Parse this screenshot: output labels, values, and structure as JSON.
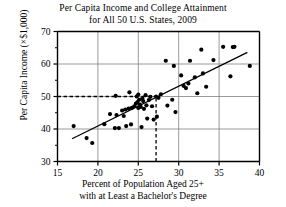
{
  "chart_data": {
    "type": "scatter",
    "title": "Per Capita Income and College Attainment for All 50 U.S. States, 2009",
    "title_lines": [
      "Per Capita Income and College Attainment",
      "for All 50 U.S. States, 2009"
    ],
    "xlabel": "Percent of Population Aged 25+ with at Least a Bachelor's Degree",
    "xlabel_lines": [
      "Percent of Population Aged 25+",
      "with at Least a Bachelor's Degree"
    ],
    "ylabel": "Per Capita Income (×$1,000)",
    "xlim": [
      15,
      40
    ],
    "ylim": [
      30,
      70
    ],
    "xticks": [
      15,
      20,
      25,
      30,
      35,
      40
    ],
    "yticks": [
      30,
      40,
      50,
      60,
      70
    ],
    "xtick_labels": [
      "15",
      "20",
      "25",
      "30",
      "35",
      "40"
    ],
    "ytick_labels": [
      "30",
      "40",
      "50",
      "60",
      "70"
    ],
    "y_minor_ticks": [
      35,
      45,
      55,
      65
    ],
    "grid": true,
    "grid_color": "#808080",
    "axis_color": "#000000",
    "point_color": "#000000",
    "point_radius": 2.1,
    "legend": null,
    "series": [
      {
        "name": "U.S. States",
        "points": [
          [
            17.0,
            40.9
          ],
          [
            18.6,
            37.2
          ],
          [
            19.3,
            35.7
          ],
          [
            20.8,
            41.5
          ],
          [
            21.5,
            44.6
          ],
          [
            22.1,
            40.3
          ],
          [
            22.2,
            50.2
          ],
          [
            22.3,
            44.3
          ],
          [
            22.6,
            40.3
          ],
          [
            23.0,
            45.7
          ],
          [
            23.2,
            44.0
          ],
          [
            23.4,
            46.0
          ],
          [
            23.5,
            40.9
          ],
          [
            23.8,
            46.3
          ],
          [
            23.9,
            51.3
          ],
          [
            24.1,
            41.4
          ],
          [
            24.2,
            46.5
          ],
          [
            24.5,
            47.0
          ],
          [
            24.7,
            47.8
          ],
          [
            24.8,
            50.0
          ],
          [
            24.9,
            48.3
          ],
          [
            25.0,
            46.5
          ],
          [
            25.0,
            50.6
          ],
          [
            25.1,
            49.0
          ],
          [
            25.2,
            47.5
          ],
          [
            25.3,
            46.8
          ],
          [
            25.4,
            40.6
          ],
          [
            25.5,
            49.4
          ],
          [
            25.6,
            48.6
          ],
          [
            25.7,
            46.2
          ],
          [
            25.9,
            50.4
          ],
          [
            26.0,
            47.3
          ],
          [
            26.1,
            43.2
          ],
          [
            26.3,
            48.9
          ],
          [
            26.5,
            49.9
          ],
          [
            26.7,
            47.0
          ],
          [
            26.9,
            42.9
          ],
          [
            27.2,
            50.0
          ],
          [
            27.3,
            43.8
          ],
          [
            27.5,
            49.6
          ],
          [
            27.8,
            50.7
          ],
          [
            28.4,
            61.0
          ],
          [
            28.6,
            47.2
          ],
          [
            29.2,
            49.0
          ],
          [
            29.4,
            59.4
          ],
          [
            29.6,
            45.2
          ],
          [
            30.3,
            56.5
          ],
          [
            30.6,
            53.3
          ],
          [
            30.9,
            52.6
          ],
          [
            31.2,
            54.0
          ],
          [
            31.4,
            61.0
          ],
          [
            32.0,
            55.9
          ],
          [
            32.3,
            51.0
          ],
          [
            32.8,
            64.4
          ],
          [
            33.0,
            57.1
          ],
          [
            33.4,
            53.0
          ],
          [
            34.3,
            61.2
          ],
          [
            35.5,
            65.3
          ],
          [
            36.4,
            56.2
          ],
          [
            36.7,
            65.2
          ],
          [
            36.9,
            65.3
          ],
          [
            38.8,
            59.4
          ]
        ]
      }
    ],
    "trend_line": {
      "name": "least-squares regression line",
      "x_start": 16.8,
      "y_start": 37.0,
      "x_end": 38.5,
      "y_end": 63.6,
      "color": "#000000"
    },
    "reference_lines": [
      {
        "name": "horizontal-reference",
        "orientation": "horizontal",
        "value": 50.0,
        "x_start": 15,
        "x_end": 27.2,
        "style": "dashed"
      },
      {
        "name": "vertical-reference",
        "orientation": "vertical",
        "value": 27.2,
        "y_start": 30,
        "y_end": 50.0,
        "style": "dashed"
      }
    ]
  }
}
